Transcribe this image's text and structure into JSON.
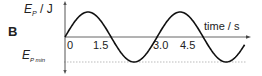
{
  "panel": {
    "label": "B"
  },
  "chart_data": {
    "type": "line",
    "title": "",
    "xlabel": "time / s",
    "ylabel": "E_P / J",
    "ylabel_main": "E",
    "ylabel_sub": "P",
    "ylabel_unit": "/ J",
    "ymin_label_main": "E",
    "ymin_label_sub": "P min",
    "x_ticks": [
      "0",
      "1.5",
      "3.0",
      "4.5"
    ],
    "x_tick_values": [
      0,
      1.5,
      3.0,
      4.5
    ],
    "function": "sine",
    "period_s": 3.0,
    "x_range": [
      0,
      5.85
    ],
    "y_range": [
      "E_P min",
      "max"
    ],
    "x": [
      0,
      0.75,
      1.5,
      2.25,
      3.0,
      3.75,
      4.5,
      5.25,
      5.85
    ],
    "y": [
      0,
      1,
      0,
      -1,
      0,
      1,
      0,
      -1,
      -0.3
    ],
    "reference_line": "dotted line at E_P min",
    "grid": false,
    "legend": null
  },
  "colors": {
    "curve": "#111111",
    "axis": "#555555",
    "dotted": "#999999"
  }
}
